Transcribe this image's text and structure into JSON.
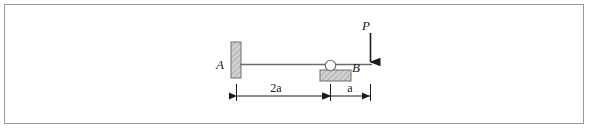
{
  "figure": {
    "type": "statics-beam-free-body-diagram",
    "title": "",
    "border_color": "#9a9a9a",
    "background_color": "#ffffff",
    "line_color": "#4d4d4d",
    "hatch_color": "#8c8c8c",
    "hatch_fill": "#cfcfcf",
    "text_color": "#1a1a1a"
  },
  "labels": {
    "support_a": "A",
    "support_b": "B",
    "load": "P"
  },
  "dimensions": [
    {
      "name": "span-a-to-b",
      "label": "2a",
      "from": "A",
      "to": "B"
    },
    {
      "name": "span-b-to-load",
      "label": "a",
      "from": "B",
      "to": "P"
    }
  ],
  "elements": {
    "beam": "horizontal-beam",
    "fixed_support": "fixed-wall-support",
    "roller_support": "roller-support",
    "load_arrow": "downward-point-load-arrow",
    "dimension_line": "dimension-line"
  }
}
